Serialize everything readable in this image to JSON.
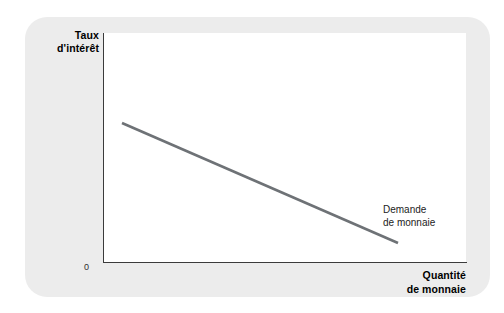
{
  "figure": {
    "background_color": "#ffffff",
    "panel_color": "#ececec",
    "plot_background": "#ffffff",
    "axis_color": "#3b3b3b",
    "curve_color": "#6e7276"
  },
  "axes": {
    "y_title_line1": "Taux",
    "y_title_line2": "d'intérêt",
    "x_title_line1": "Quantité",
    "x_title_line2": "de monnaie",
    "origin_label": "0"
  },
  "annotations": {
    "curve_label_line1": "Demande",
    "curve_label_line2": "de monnaie"
  },
  "chart_data": {
    "type": "line",
    "title": "",
    "subtitle": "",
    "xlabel": "Quantité de monnaie",
    "ylabel": "Taux d'intérêt",
    "grid": false,
    "legend_position": "inline-annotation",
    "axis_style": "L-shaped, no tick marks, no numeric scale",
    "xlim": [
      0,
      1
    ],
    "ylim": [
      0,
      1
    ],
    "xticks": [
      "0"
    ],
    "yticks": [],
    "series": [
      {
        "name": "Demande de monnaie",
        "color": "#6e7276",
        "line_width_px": 2.6,
        "annotation": "Demande de monnaie",
        "description": "Downward-sloping straight money demand curve",
        "points_px": [
          [
            122,
            123
          ],
          [
            398,
            243
          ]
        ],
        "x": [
          0.052,
          0.812
        ],
        "y": [
          0.607,
          0.083
        ]
      }
    ]
  }
}
